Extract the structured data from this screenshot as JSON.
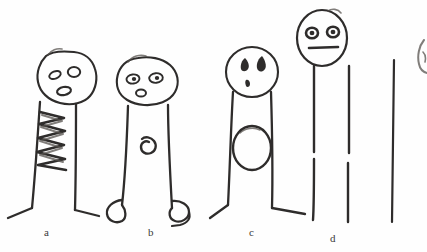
{
  "image": {
    "kind": "scanned-pencil-sketch",
    "title": "Hand-drawn stick figures a through d",
    "width": 427,
    "height": 252,
    "background_color": "#fefefe",
    "ink_color": "#2e2c2b",
    "soft_ink_color": "#55514e"
  },
  "labels": [
    {
      "id": "a",
      "text": "a",
      "x": 44,
      "y": 230
    },
    {
      "id": "b",
      "text": "b",
      "x": 148,
      "y": 230
    },
    {
      "id": "c",
      "text": "c",
      "x": 249,
      "y": 230
    },
    {
      "id": "d",
      "text": "d",
      "x": 330,
      "y": 236
    }
  ],
  "figures": [
    {
      "id": "a",
      "label": "a",
      "head_shape": "rounded-blob",
      "eyes": "two-open-ovals-slanted",
      "mouth": "open-oval",
      "torso_marking": "zigzag-scribble",
      "feet": "flat-angled-lines",
      "description": "Tall figure with a wide rounded head, two slanted oval eyes, an open oval mouth, a vertical zigzag scribble down the upper torso, and flat splayed feet."
    },
    {
      "id": "b",
      "label": "b",
      "head_shape": "wide-oval",
      "eyes": "two-ovals-with-pupils",
      "mouth": "small-oval",
      "torso_marking": "small-spiral",
      "feet": "rounded-loops",
      "description": "Figure with a wide oval head, two ringed eyes with pupils, a small oval mouth, a small spiral button on the torso, and rounded loop feet."
    },
    {
      "id": "c",
      "label": "c",
      "head_shape": "round",
      "eyes": "two-teardrops",
      "mouth": "small-mark",
      "torso_marking": "large-oval",
      "feet": "pointed-angled",
      "description": "Figure with a round head, two teardrop eyes, a small mouth mark, a large empty oval on the torso, and pointed angled feet."
    },
    {
      "id": "d",
      "label": "d",
      "head_shape": "tall-oval",
      "eyes": "two-filled-ovals",
      "mouth": "straight-line",
      "torso_marking": "none",
      "feet": "none",
      "description": "Tallest figure with a tall oval head, two dark filled eyes, a straight line mouth, and two plain broken vertical legs with no feet."
    },
    {
      "id": "e",
      "label": "",
      "head_shape": "cropped",
      "eyes": "not-visible",
      "mouth": "not-visible",
      "torso_marking": "none",
      "feet": "none",
      "description": "Partial fifth figure cropped by the right edge of the frame; only a single long vertical stroke and a faint head fragment are visible."
    }
  ]
}
